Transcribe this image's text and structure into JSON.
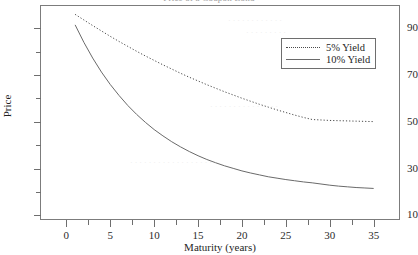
{
  "chart_data": {
    "type": "line",
    "title": "Price of a Coupon Bond",
    "xlabel": "Maturity (years)",
    "ylabel": "Price",
    "xlim": [
      -3,
      38
    ],
    "ylim": [
      8,
      100
    ],
    "grid": false,
    "legend_position": "top-right",
    "xticks": [
      0,
      5,
      10,
      15,
      20,
      25,
      30,
      35
    ],
    "xtick_labels": [
      "0",
      "5",
      "10",
      "15",
      "20",
      "25",
      "30",
      "35"
    ],
    "xticks_minor": [
      2.5,
      7.5,
      12.5,
      17.5,
      22.5,
      27.5,
      32.5
    ],
    "yticks": [
      10,
      30,
      50,
      70,
      90
    ],
    "ytick_labels": [
      "10",
      "30",
      "50",
      "70",
      "90"
    ],
    "yticks_minor": [
      20,
      40,
      60,
      80
    ],
    "x": [
      1,
      2,
      3,
      4,
      5,
      6,
      7,
      8,
      9,
      10,
      11,
      12,
      13,
      14,
      15,
      16,
      17,
      18,
      19,
      20,
      21,
      22,
      23,
      24,
      25,
      26,
      27,
      28,
      29,
      30,
      31,
      32,
      33,
      34,
      35
    ],
    "series": [
      {
        "name": "5% Yield",
        "style": "dotted",
        "color": "#4a4a4a",
        "values": [
          96.0,
          93.6,
          91.2,
          88.9,
          86.6,
          84.4,
          82.3,
          80.2,
          78.2,
          76.3,
          74.4,
          72.6,
          70.8,
          69.1,
          67.5,
          65.9,
          64.4,
          62.9,
          61.5,
          60.1,
          58.8,
          57.5,
          56.3,
          55.1,
          54.0,
          52.9,
          51.9,
          51.0,
          50.8,
          50.6,
          50.5,
          50.4,
          50.3,
          50.2,
          50.1
        ]
      },
      {
        "name": "10% Yield",
        "style": "solid",
        "color": "#6a6a6a",
        "values": [
          91.5,
          84.0,
          77.3,
          71.3,
          66.0,
          61.3,
          57.0,
          53.2,
          49.8,
          46.7,
          44.0,
          41.5,
          39.3,
          37.3,
          35.5,
          33.9,
          32.5,
          31.2,
          30.1,
          29.0,
          28.1,
          27.3,
          26.5,
          25.9,
          25.3,
          24.8,
          24.3,
          23.9,
          23.4,
          22.9,
          22.5,
          22.2,
          21.9,
          21.7,
          21.5
        ]
      }
    ]
  },
  "legend": {
    "items": [
      {
        "label": "5% Yield"
      },
      {
        "label": "10% Yield"
      }
    ]
  }
}
